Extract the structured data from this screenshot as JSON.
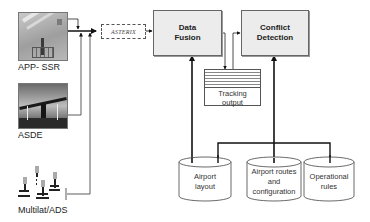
{
  "diagram": {
    "sources": [
      {
        "id": "app-ssr",
        "label": "APP- SSR",
        "icon": "radar-antenna-photo"
      },
      {
        "id": "asde",
        "label": "ASDE",
        "icon": "surface-radar-photo"
      },
      {
        "id": "multilat",
        "label": "Multilat/ADS",
        "icon": "multilateration-antennas"
      }
    ],
    "format": {
      "label": "ASTERIX"
    },
    "processes": [
      {
        "id": "data-fusion",
        "line1": "Data",
        "line2": "Fusion"
      },
      {
        "id": "conflict-detection",
        "line1": "Conflict",
        "line2": "Detection"
      }
    ],
    "tracking_output": {
      "line1": "Tracking",
      "line2": "output"
    },
    "databases": [
      {
        "id": "airport-layout",
        "line1": "Airport",
        "line2": "layout",
        "line3": ""
      },
      {
        "id": "airport-routes",
        "line1": "Airport routes",
        "line2": "and",
        "line3": "configuration"
      },
      {
        "id": "operational-rules",
        "line1": "Operational",
        "line2": "rules",
        "line3": ""
      }
    ],
    "edges": [
      {
        "from": "APP- SSR",
        "to": "ASTERIX"
      },
      {
        "from": "ASDE",
        "to": "ASTERIX"
      },
      {
        "from": "Multilat/ADS",
        "to": "ASTERIX"
      },
      {
        "from": "ASTERIX",
        "to": "Data Fusion"
      },
      {
        "from": "Data Fusion",
        "to": "Tracking output"
      },
      {
        "from": "Tracking output",
        "to": "Conflict Detection"
      },
      {
        "from": "Airport layout",
        "to": "Data Fusion"
      },
      {
        "from": "Airport routes and configuration",
        "to": "Conflict Detection"
      },
      {
        "from": "Operational rules",
        "to": "Conflict Detection"
      },
      {
        "from": "Airport layout",
        "to": "Conflict Detection"
      }
    ]
  }
}
